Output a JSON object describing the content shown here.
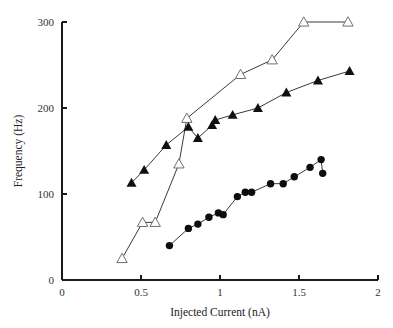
{
  "chart_data": {
    "type": "scatter",
    "title": "",
    "xlabel": "Injected Current (nA)",
    "ylabel": "Frequency (Hz)",
    "xlim": [
      0,
      2
    ],
    "ylim": [
      0,
      300
    ],
    "xticks": [
      "0",
      "0.5",
      "1",
      "1.5",
      "2"
    ],
    "xtick_values": [
      0,
      0.5,
      1,
      1.5,
      2
    ],
    "yticks": [
      "0",
      "100",
      "200",
      "300"
    ],
    "ytick_values": [
      0,
      100,
      200,
      300
    ],
    "grid": false,
    "legend": "none",
    "series": [
      {
        "name": "open-triangles",
        "marker": "open-triangle",
        "connected": true,
        "points": [
          {
            "x": 0.38,
            "y": 25
          },
          {
            "x": 0.51,
            "y": 67
          },
          {
            "x": 0.59,
            "y": 67
          },
          {
            "x": 0.74,
            "y": 135
          },
          {
            "x": 0.79,
            "y": 188
          },
          {
            "x": 1.13,
            "y": 239
          },
          {
            "x": 1.33,
            "y": 256
          },
          {
            "x": 1.53,
            "y": 300
          },
          {
            "x": 1.81,
            "y": 300
          }
        ]
      },
      {
        "name": "filled-triangles",
        "marker": "filled-triangle",
        "connected": true,
        "points": [
          {
            "x": 0.44,
            "y": 113
          },
          {
            "x": 0.52,
            "y": 128
          },
          {
            "x": 0.66,
            "y": 157
          },
          {
            "x": 0.8,
            "y": 178
          },
          {
            "x": 0.86,
            "y": 165
          },
          {
            "x": 0.95,
            "y": 180
          },
          {
            "x": 0.97,
            "y": 186
          },
          {
            "x": 1.08,
            "y": 192
          },
          {
            "x": 1.24,
            "y": 200
          },
          {
            "x": 1.42,
            "y": 218
          },
          {
            "x": 1.62,
            "y": 232
          },
          {
            "x": 1.82,
            "y": 243
          }
        ]
      },
      {
        "name": "filled-circles",
        "marker": "filled-circle",
        "connected": true,
        "points": [
          {
            "x": 0.68,
            "y": 40
          },
          {
            "x": 0.8,
            "y": 60
          },
          {
            "x": 0.86,
            "y": 65
          },
          {
            "x": 0.93,
            "y": 73
          },
          {
            "x": 0.99,
            "y": 78
          },
          {
            "x": 1.02,
            "y": 76
          },
          {
            "x": 1.11,
            "y": 97
          },
          {
            "x": 1.16,
            "y": 102
          },
          {
            "x": 1.2,
            "y": 102
          },
          {
            "x": 1.32,
            "y": 112
          },
          {
            "x": 1.4,
            "y": 112
          },
          {
            "x": 1.47,
            "y": 120
          },
          {
            "x": 1.57,
            "y": 131
          },
          {
            "x": 1.64,
            "y": 140
          },
          {
            "x": 1.65,
            "y": 124
          }
        ]
      }
    ],
    "colors": {
      "axis": "#1a1a1a",
      "filled_marker": "#101010",
      "open_marker_stroke": "#707070",
      "line": "#3a3a3a",
      "background": "#ffffff"
    }
  }
}
